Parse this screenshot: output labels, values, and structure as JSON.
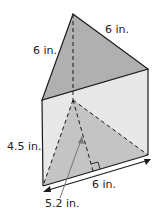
{
  "figure": {
    "type": "triangular-prism",
    "labels": {
      "top_left_edge": "6 in.",
      "top_right_edge": "6 in.",
      "height": "4.5 in.",
      "base_edge": "6 in.",
      "triangle_height": "5.2 in."
    },
    "colors": {
      "top_face": "#b0b0b0",
      "side_face": "#e6e6e6",
      "bottom_triangle": "#c2c2c2",
      "stroke": "#1a1a1a",
      "arrow": "#777777"
    }
  }
}
